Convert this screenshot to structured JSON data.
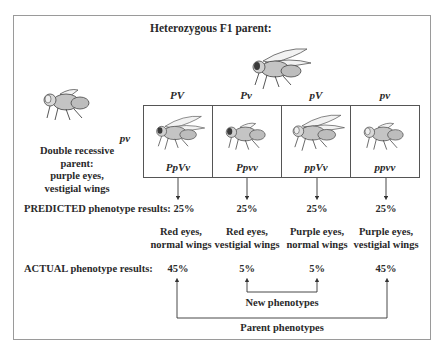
{
  "title": "Heterozygous F1 parent:",
  "double_recessive_parent": {
    "label_lines": [
      "Double recessive",
      "parent:",
      "purple eyes,",
      "vestigial wings"
    ],
    "gamete": "pv"
  },
  "f1_gametes": [
    "PV",
    "Pv",
    "pV",
    "pv"
  ],
  "offspring": [
    {
      "genotype": "PpVv",
      "predicted": "25%",
      "phenotype_lines": [
        "Red eyes,",
        "normal wings"
      ],
      "actual": "45%",
      "wings": "normal",
      "eyes": "red"
    },
    {
      "genotype": "Ppvv",
      "predicted": "25%",
      "phenotype_lines": [
        "Red eyes,",
        "vestigial wings"
      ],
      "actual": "5%",
      "wings": "vestigial",
      "eyes": "red"
    },
    {
      "genotype": "ppVv",
      "predicted": "25%",
      "phenotype_lines": [
        "Purple eyes,",
        "normal wings"
      ],
      "actual": "5%",
      "wings": "normal",
      "eyes": "purple"
    },
    {
      "genotype": "ppvv",
      "predicted": "25%",
      "phenotype_lines": [
        "Purple eyes,",
        "vestigial wings"
      ],
      "actual": "45%",
      "wings": "vestigial",
      "eyes": "purple"
    }
  ],
  "rows": {
    "predicted_label": "PREDICTED phenotype results:",
    "actual_label": "ACTUAL phenotype results:"
  },
  "brackets": {
    "new": "New phenotypes",
    "parent": "Parent phenotypes"
  },
  "colors": {
    "frame": "#9a9a9a",
    "ink": "#2a2a2a",
    "fly_body": "#bdbdbd",
    "red_eye": "#3a3a3a",
    "purple_eye": "#e8e8e8"
  }
}
